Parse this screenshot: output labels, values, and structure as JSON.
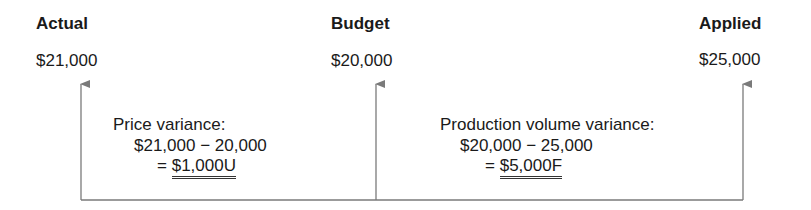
{
  "columns": [
    {
      "heading": "Actual",
      "amount": "$21,000"
    },
    {
      "heading": "Budget",
      "amount": "$20,000"
    },
    {
      "heading": "Applied",
      "amount": "$25,000"
    }
  ],
  "variances": [
    {
      "label": "Price variance:",
      "formula": "$21,000 − 20,000",
      "equals": "=",
      "result": "$1,000U"
    },
    {
      "label": "Production volume variance:",
      "formula": "$20,000 − 25,000",
      "equals": "=",
      "result": "$5,000F"
    }
  ],
  "colors": {
    "line": "#7a7a7a",
    "text": "#1a1a1a"
  }
}
